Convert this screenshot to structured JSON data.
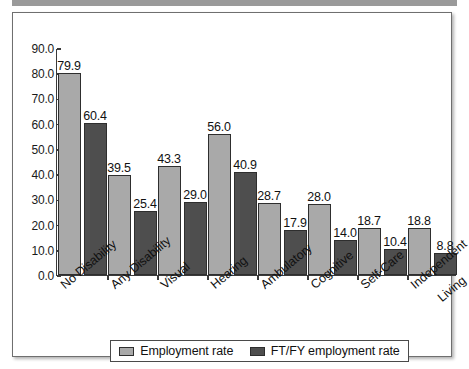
{
  "figure": {
    "top_strip": "gray-band"
  },
  "chart_data": {
    "type": "bar",
    "title": "",
    "subtitle": "",
    "xlabel": "",
    "ylabel": "",
    "ylim": [
      0.0,
      90.0
    ],
    "ytick_step": 10.0,
    "ytick_labels": [
      "90.0",
      "80.0",
      "70.0",
      "60.0",
      "50.0",
      "40.0",
      "30.0",
      "20.0",
      "10.0",
      "0.0"
    ],
    "ytick_values": [
      90.0,
      80.0,
      70.0,
      60.0,
      50.0,
      40.0,
      30.0,
      20.0,
      10.0,
      0.0
    ],
    "grid": false,
    "legend_position": "bottom",
    "categories": [
      "No Disability",
      "Any Disability",
      "Visual",
      "Hearing",
      "Ambulatory",
      "Cognitive",
      "Self-Care",
      "Independent Living"
    ],
    "category_label_lines": [
      [
        "No Disability"
      ],
      [
        "Any Disability"
      ],
      [
        "Visual"
      ],
      [
        "Hearing"
      ],
      [
        "Ambulatory"
      ],
      [
        "Cognitive"
      ],
      [
        "Self-Care"
      ],
      [
        "Independent",
        "Living"
      ]
    ],
    "series": [
      {
        "name": "Employment rate",
        "color": "#a9a9a9",
        "values": [
          79.9,
          39.5,
          43.3,
          56.0,
          28.7,
          28.0,
          18.7,
          18.8
        ],
        "value_labels": [
          "79.9",
          "39.5",
          "43.3",
          "56.0",
          "28.7",
          "28.0",
          "18.7",
          "18.8"
        ]
      },
      {
        "name": "FT/FY employment rate",
        "color": "#4e4e4e",
        "values": [
          60.4,
          25.4,
          29.0,
          40.9,
          17.9,
          14.0,
          10.4,
          8.8
        ],
        "value_labels": [
          "60.4",
          "25.4",
          "29.0",
          "40.9",
          "17.9",
          "14.0",
          "10.4",
          "8.8"
        ]
      }
    ]
  }
}
